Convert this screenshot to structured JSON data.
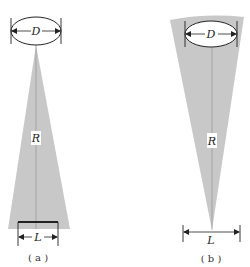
{
  "figure": {
    "panels": [
      {
        "id": "a",
        "caption": "( a )",
        "diameter_label": "D",
        "radius_label": "R",
        "length_label": "L",
        "description": "Narrow beam cone expanding from aperture D down to footprint L, with a bar marking L"
      },
      {
        "id": "b",
        "caption": "( b )",
        "diameter_label": "D",
        "radius_label": "R",
        "length_label": "L",
        "description": "Wide cone from curved aperture region containing D converging to a point above width L"
      }
    ],
    "colors": {
      "wedge_fill": "#c8c8c8",
      "line": "#222222",
      "background": "#ffffff"
    }
  }
}
